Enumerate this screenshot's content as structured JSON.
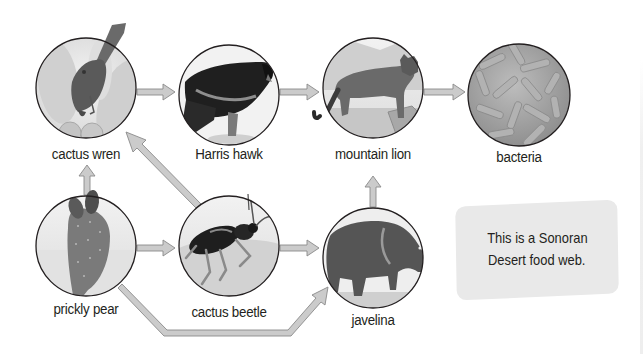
{
  "diagram": {
    "type": "food web",
    "info_box": {
      "line1": "This is a Sonoran",
      "line2": "Desert food web."
    },
    "colors": {
      "arrow_fill": "#c8c8c8",
      "arrow_stroke": "#8a8a8a",
      "circle_stroke": "#231f20",
      "circle_bg": "#e6e6e6",
      "info_box_bg": "#e9e9e9",
      "text": "#231f20"
    },
    "nodes": [
      {
        "id": "cactus-wren",
        "label": "cactus wren",
        "cx": 86,
        "cy": 88
      },
      {
        "id": "harris-hawk",
        "label": "Harris hawk",
        "cx": 229,
        "cy": 95
      },
      {
        "id": "mountain-lion",
        "label": "mountain lion",
        "cx": 373,
        "cy": 88
      },
      {
        "id": "bacteria",
        "label": "bacteria",
        "cx": 519,
        "cy": 95
      },
      {
        "id": "prickly-pear",
        "label": "prickly pear",
        "cx": 86,
        "cy": 246
      },
      {
        "id": "cactus-beetle",
        "label": "cactus beetle",
        "cx": 229,
        "cy": 246
      },
      {
        "id": "javelina",
        "label": "javelina",
        "cx": 373,
        "cy": 258
      }
    ],
    "edges": [
      {
        "from": "cactus wren",
        "to": "Harris hawk"
      },
      {
        "from": "Harris hawk",
        "to": "mountain lion"
      },
      {
        "from": "mountain lion",
        "to": "bacteria"
      },
      {
        "from": "prickly pear",
        "to": "cactus wren"
      },
      {
        "from": "prickly pear",
        "to": "cactus beetle"
      },
      {
        "from": "prickly pear",
        "to": "javelina"
      },
      {
        "from": "cactus beetle",
        "to": "cactus wren"
      },
      {
        "from": "cactus beetle",
        "to": "javelina"
      },
      {
        "from": "javelina",
        "to": "mountain lion"
      }
    ]
  }
}
